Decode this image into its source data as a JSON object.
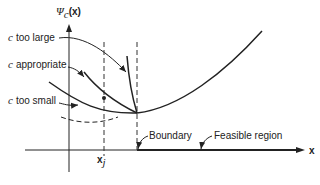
{
  "diagram": {
    "y_axis_label": {
      "symbol": "Ψ",
      "subscript": "c",
      "arg": "(x)"
    },
    "x_axis_label": "x",
    "x_tick_label": {
      "base": "x",
      "subscript": "j"
    },
    "curves": [
      {
        "c": "c",
        "label": "too large"
      },
      {
        "c": "c",
        "label": "appropriate"
      },
      {
        "c": "c",
        "label": "too small"
      }
    ],
    "annotations": {
      "boundary": "Boundary",
      "feasible_region": "Feasible region"
    },
    "colors": {
      "ink": "#222222",
      "background": "#ffffff"
    }
  }
}
